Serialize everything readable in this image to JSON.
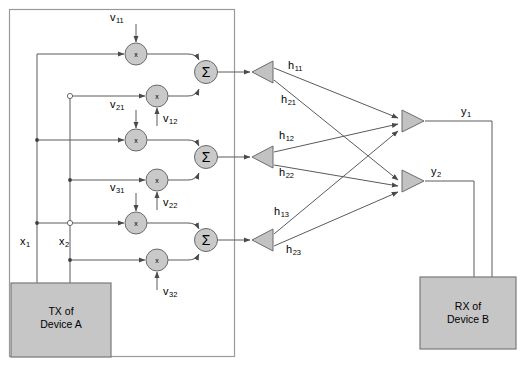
{
  "diagram": {
    "colors": {
      "line": "#5a5a5a",
      "node_fill": "#c9c9c9",
      "node_stroke": "#6b6b6b",
      "box_fill": "#c6c6c6",
      "box_stroke": "#7a7a7a",
      "border": "#9a9a9a",
      "text": "#000000"
    },
    "tx_block": {
      "line1": "TX of",
      "line2": "Device A"
    },
    "rx_block": {
      "line1": "RX of",
      "line2": "Device B"
    },
    "inputs": [
      {
        "id": "x1",
        "base": "x",
        "sub": "1"
      },
      {
        "id": "x2",
        "base": "x",
        "sub": "2"
      }
    ],
    "weights": [
      {
        "id": "v11",
        "base": "v",
        "sub": "11"
      },
      {
        "id": "v21",
        "base": "v",
        "sub": "21"
      },
      {
        "id": "v31",
        "base": "v",
        "sub": "31"
      },
      {
        "id": "v12",
        "base": "v",
        "sub": "12"
      },
      {
        "id": "v22",
        "base": "v",
        "sub": "22"
      },
      {
        "id": "v32",
        "base": "v",
        "sub": "32"
      }
    ],
    "multiplier_glyph": "x",
    "summer_glyph": "Σ",
    "summers": [
      {
        "id": "sum1"
      },
      {
        "id": "sum2"
      },
      {
        "id": "sum3"
      }
    ],
    "tx_antennas": [
      {
        "id": "tx-ant-1"
      },
      {
        "id": "tx-ant-2"
      },
      {
        "id": "tx-ant-3"
      }
    ],
    "rx_antennas": [
      {
        "id": "rx-ant-1"
      },
      {
        "id": "rx-ant-2"
      }
    ],
    "channels": [
      {
        "id": "h11",
        "base": "h",
        "sub": "11"
      },
      {
        "id": "h21",
        "base": "h",
        "sub": "21"
      },
      {
        "id": "h12",
        "base": "h",
        "sub": "12"
      },
      {
        "id": "h22",
        "base": "h",
        "sub": "22"
      },
      {
        "id": "h13",
        "base": "h",
        "sub": "13"
      },
      {
        "id": "h23",
        "base": "h",
        "sub": "23"
      }
    ],
    "outputs": [
      {
        "id": "y1",
        "base": "y",
        "sub": "1"
      },
      {
        "id": "y2",
        "base": "y",
        "sub": "2"
      }
    ]
  }
}
